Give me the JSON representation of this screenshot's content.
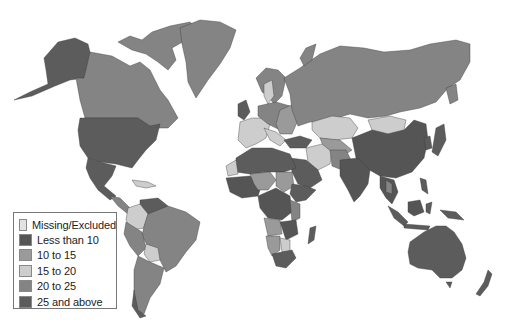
{
  "map": {
    "type": "choropleth world map",
    "colors": {
      "missing": "#e3e3e3",
      "lt10": "#555555",
      "10_15": "#9a9a9a",
      "15_20": "#cdcdcd",
      "20_25": "#848484",
      "25_plus": "#5c5c5c"
    }
  },
  "legend": {
    "items": [
      {
        "label": "Missing/Excluded",
        "color": "#e3e3e3"
      },
      {
        "label": "Less than 10",
        "color": "#555555"
      },
      {
        "label": "10 to 15",
        "color": "#9a9a9a"
      },
      {
        "label": "15 to 20",
        "color": "#cdcdcd"
      },
      {
        "label": "20 to 25",
        "color": "#848484"
      },
      {
        "label": "25 and above",
        "color": "#5c5c5c"
      }
    ]
  }
}
